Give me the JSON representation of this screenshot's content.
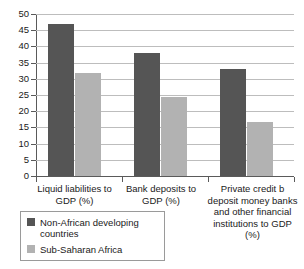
{
  "chart_data": {
    "type": "bar",
    "title": "",
    "xlabel": "",
    "ylabel": "",
    "ylim": [
      0,
      50
    ],
    "yticks": [
      0,
      5,
      10,
      15,
      20,
      25,
      30,
      35,
      40,
      45,
      50
    ],
    "ytick_labels": [
      "0",
      "5",
      "10",
      "15",
      "20",
      "25",
      "30",
      "35",
      "40",
      "45",
      "50"
    ],
    "grid": true,
    "legend_position": "bottom-left",
    "categories": [
      "Liquid liabilities to GDP (%)",
      "Bank deposits to GDP (%)",
      "Private credit b deposit money banks and other financial institutions to GDP (%)"
    ],
    "series": [
      {
        "name": "Non-African developing countries",
        "color": "#555555",
        "values": [
          47,
          38,
          33
        ]
      },
      {
        "name": "Sub-Saharan Africa",
        "color": "#b2b2b2",
        "values": [
          31.7,
          24.4,
          16.6
        ]
      }
    ]
  },
  "axis": {
    "ticks": [
      {
        "label": "50",
        "value": 50
      },
      {
        "label": "45",
        "value": 45
      },
      {
        "label": "40",
        "value": 40
      },
      {
        "label": "35",
        "value": 35
      },
      {
        "label": "30",
        "value": 30
      },
      {
        "label": "25",
        "value": 25
      },
      {
        "label": "20",
        "value": 20
      },
      {
        "label": "15",
        "value": 15
      },
      {
        "label": "10",
        "value": 10
      },
      {
        "label": "5",
        "value": 5
      },
      {
        "label": "0",
        "value": 0
      }
    ]
  },
  "x_labels": [
    "Liquid liabilities to GDP (%)",
    "Bank deposits to GDP (%)",
    "Private credit b deposit money banks and other financial institutions to GDP (%)"
  ],
  "legend": {
    "items": [
      {
        "label": "Non-African developing countries",
        "color": "#555555"
      },
      {
        "label": "Sub-Saharan Africa",
        "color": "#b2b2b2"
      }
    ]
  },
  "colors": {
    "series_dark": "#555555",
    "series_light": "#b2b2b2",
    "gridline": "#bdbdbd",
    "axis": "#5a5a5a",
    "legend_border": "#9a9a9a",
    "text": "#1a1a1a",
    "background": "#ffffff"
  }
}
